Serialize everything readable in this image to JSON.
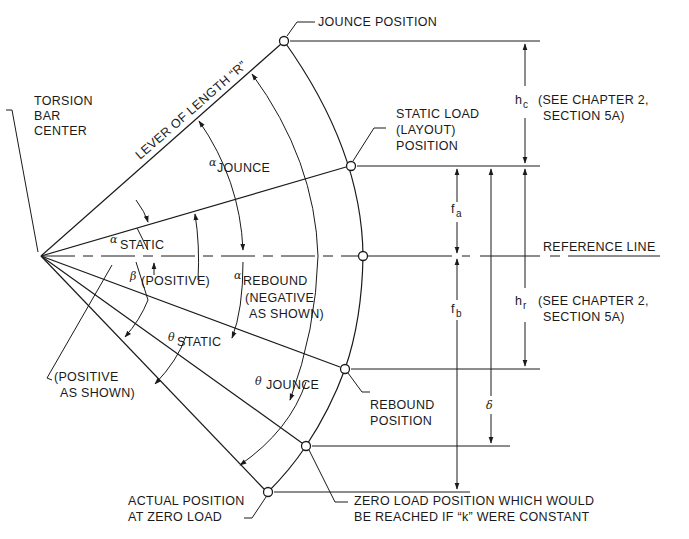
{
  "diagram": {
    "type": "torsion-bar-lever-geometry",
    "center_label": [
      "TORSION",
      "BAR",
      "CENTER"
    ],
    "lever_label": "LEVER OF LENGTH “R”",
    "positions": {
      "jounce": "JOUNCE POSITION",
      "static": [
        "STATIC LOAD",
        "(LAYOUT)",
        "POSITION"
      ],
      "reference": "REFERENCE LINE",
      "rebound": [
        "REBOUND",
        "POSITION"
      ],
      "actual_zero": [
        "ACTUAL POSITION",
        "AT ZERO LOAD"
      ],
      "zero_k": [
        "ZERO LOAD POSITION WHICH WOULD",
        "BE REACHED IF “k” WERE CONSTANT"
      ]
    },
    "angles": {
      "alpha_jounce": {
        "symbol": "α",
        "sub": "JOUNCE"
      },
      "alpha_static": {
        "symbol": "α",
        "sub": "STATIC"
      },
      "alpha_rebound": {
        "symbol": "α",
        "sub": "REBOUND",
        "note": [
          "(NEGATIVE",
          "AS SHOWN)"
        ]
      },
      "beta": {
        "symbol": "β",
        "note": "(POSITIVE)"
      },
      "theta_static": {
        "symbol": "θ",
        "sub": "STATIC"
      },
      "theta_jounce": {
        "symbol": "θ",
        "sub": "JOUNCE"
      },
      "alpha_static_note": [
        "(POSITIVE",
        "AS SHOWN)"
      ]
    },
    "dimensions": {
      "hc": {
        "symbol": "h",
        "sub": "c",
        "note": [
          "(SEE CHAPTER 2,",
          "SECTION 5A)"
        ]
      },
      "hr": {
        "symbol": "h",
        "sub": "r",
        "note": [
          "(SEE CHAPTER 2,",
          "SECTION 5A)"
        ]
      },
      "fa": {
        "symbol": "f",
        "sub": "a"
      },
      "fb": {
        "symbol": "f",
        "sub": "b"
      },
      "delta": {
        "symbol": "δ"
      }
    }
  }
}
